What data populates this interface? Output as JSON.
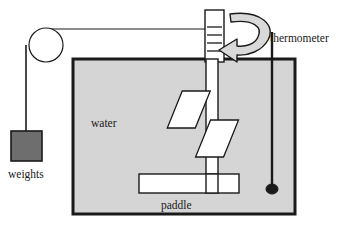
{
  "figure": {
    "background_color": "#ffffff",
    "line_color": "#1a1a1a",
    "tank_fill": "#d5d5d5",
    "weight_fill": "#6e6e6e",
    "blade_fill": "#ffffff",
    "arrow_fill": "#d9d9d9",
    "pulley_fill": "#ffffff"
  },
  "labels": {
    "water": "water",
    "paddle": "paddle",
    "weights": "weights",
    "thermometer": "thermometer"
  },
  "parts": {
    "pulley": "pulley-wheel",
    "string": "string-cord",
    "spool": "winding-spool",
    "spool_windings": 4,
    "rotation_arrow": "rotation-arrow",
    "shaft": "paddle-shaft",
    "blade_upper_left": "paddle-blade-upper-left",
    "blade_lower_right": "paddle-blade-lower-right",
    "paddle_bar": "paddle-horizontal-bar",
    "thermometer_stem": "thermometer-stem",
    "thermometer_bulb": "thermometer-bulb",
    "tank": "water-tank",
    "weight_block": "weight-block"
  }
}
